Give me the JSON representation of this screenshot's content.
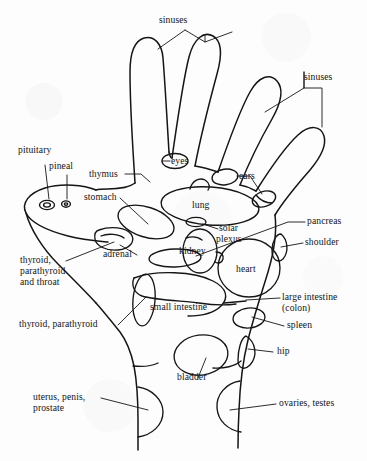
{
  "diagram": {
    "ink_color": "#151515",
    "background_color": "#fdfdfd"
  },
  "labels": {
    "sinuses_top": "sinuses",
    "sinuses_right": "sinuses",
    "pituitary": "pituitary",
    "pineal": "pineal",
    "thymus": "thymus",
    "eyes": "eyes",
    "ears": "ears",
    "stomach": "stomach",
    "lung": "lung",
    "solar_plexus_line1": "solar",
    "solar_plexus_line2": "plexus",
    "pancreas": "pancreas",
    "shoulder": "shoulder",
    "adrenal": "adrenal",
    "kidney": "kidney",
    "heart": "heart",
    "thyroid_throat_line1": "thyroid,",
    "thyroid_throat_line2": "parathyroid",
    "thyroid_throat_line3": "and throat",
    "large_intestine_line1": "large intestine",
    "large_intestine_line2": "(colon)",
    "small_intestine": "small intestine",
    "spleen": "spleen",
    "thyroid_parathyroid": "thyroid, parathyroid",
    "hip": "hip",
    "bladder": "bladder",
    "uterus_line1": "uterus, penis,",
    "uterus_line2": "prostate",
    "ovaries_testes": "ovaries, testes"
  }
}
